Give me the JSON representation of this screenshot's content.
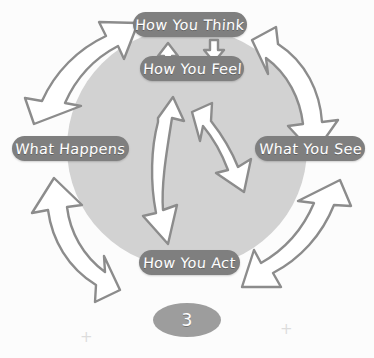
{
  "diagram": {
    "circle": {
      "fill_color": "#d2d2d2",
      "center_x": 187,
      "center_y": 148,
      "radius": 120
    },
    "pill_color": "#7f7f7f",
    "pill_text_color": "#ffffff",
    "arrow_fill": "#ffffff",
    "arrow_stroke": "#8c8c8c",
    "nodes": [
      {
        "id": "think",
        "label": "How You Think",
        "position": "top"
      },
      {
        "id": "feel",
        "label": "How You Feel",
        "position": "upper-center"
      },
      {
        "id": "see",
        "label": "What You See",
        "position": "right"
      },
      {
        "id": "act",
        "label": "How You Act",
        "position": "bottom"
      },
      {
        "id": "happens",
        "label": "What Happens",
        "position": "left"
      }
    ],
    "arrows": [
      {
        "id": "arrow-top-right",
        "name": "arrow-think-to-see",
        "direction": "clockwise-down-right"
      },
      {
        "id": "arrow-bottom-right",
        "name": "arrow-see-to-act",
        "direction": "clockwise-down-left"
      },
      {
        "id": "arrow-bottom-left",
        "name": "arrow-act-to-happens",
        "direction": "clockwise-up-left"
      },
      {
        "id": "arrow-top-left",
        "name": "arrow-happens-to-think",
        "direction": "clockwise-up-right"
      },
      {
        "id": "arrow-inner-left",
        "name": "arrow-inner-up-left",
        "direction": "inward-up"
      },
      {
        "id": "arrow-inner-right",
        "name": "arrow-inner-up-right",
        "direction": "inward-up"
      },
      {
        "id": "arrow-link-up",
        "name": "arrow-feel-to-think",
        "direction": "up"
      },
      {
        "id": "arrow-link-down",
        "name": "arrow-think-to-feel",
        "direction": "down"
      }
    ]
  },
  "footer": {
    "page_number": "3",
    "crosshair_left": "+",
    "crosshair_right": "+"
  }
}
